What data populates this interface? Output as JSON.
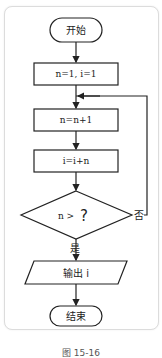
{
  "flowchart": {
    "start": "开始",
    "init": "n=1, i=1",
    "step1": "n=n+1",
    "step2": "i=i+n",
    "condition_prefix": "n >",
    "condition_unknown": "?",
    "yes_label": "是",
    "no_label": "否",
    "output": "输出 i",
    "end": "结束"
  },
  "caption": "图 15-16"
}
